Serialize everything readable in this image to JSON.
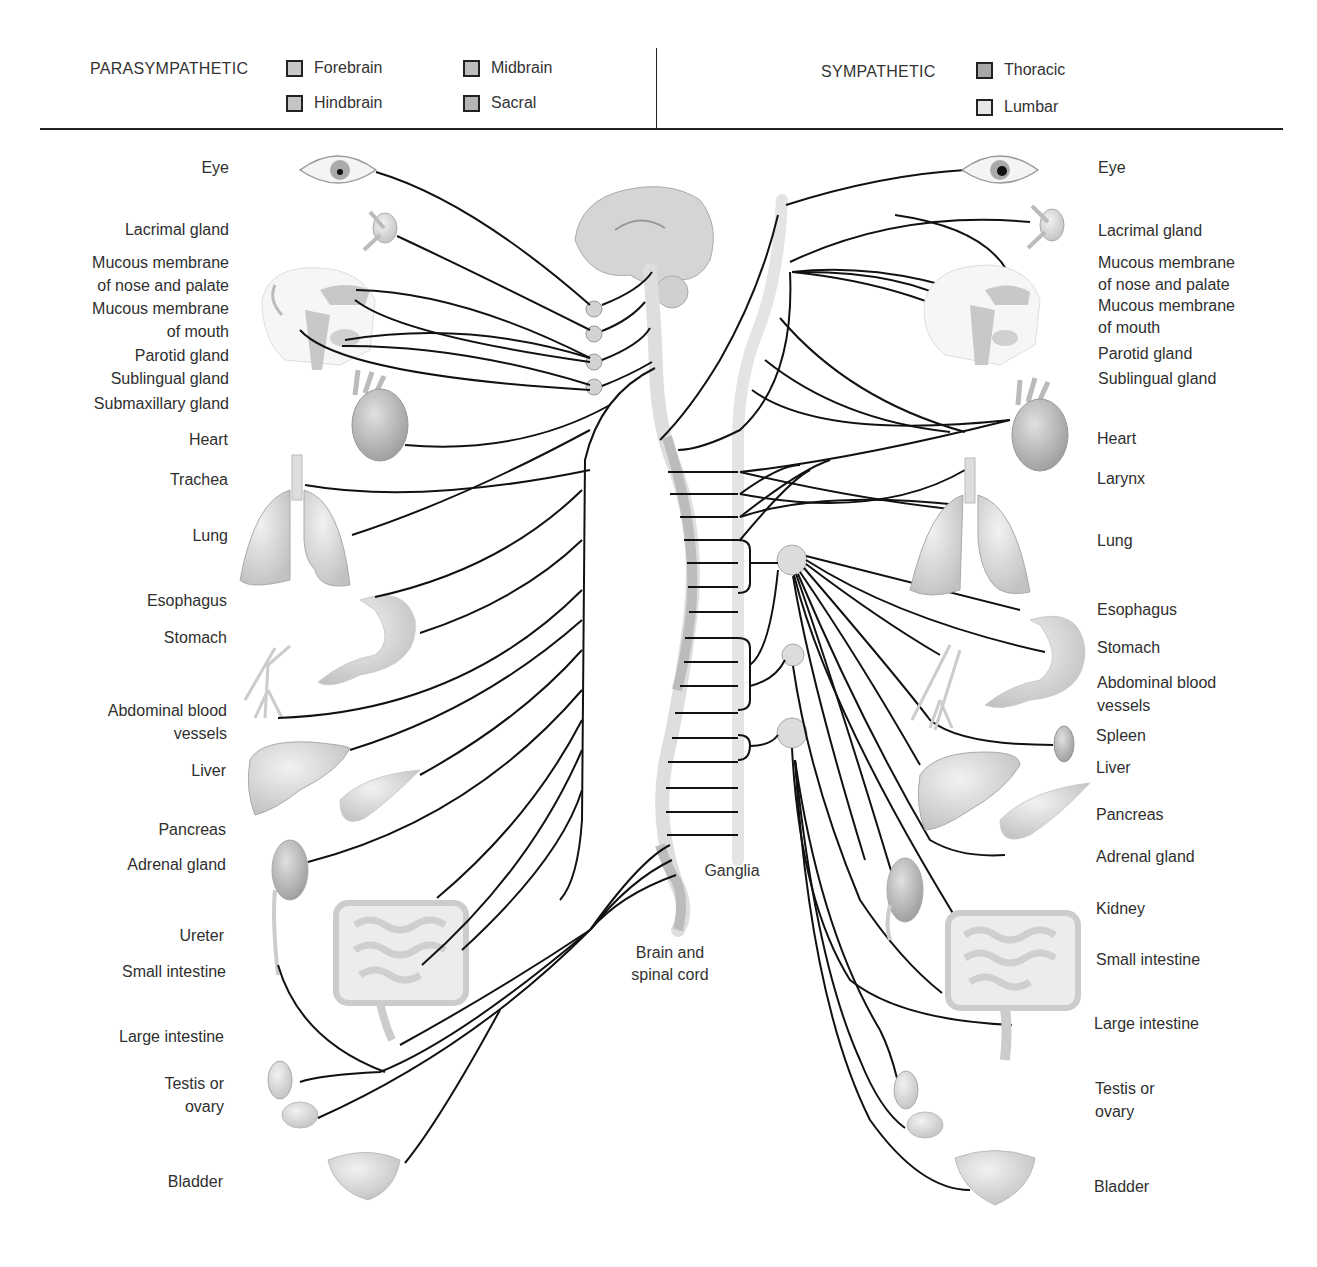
{
  "legend": {
    "parasympathetic": {
      "title": "PARASYMPATHETIC",
      "items": [
        {
          "label": "Forebrain",
          "color": "#c8c8c8"
        },
        {
          "label": "Midbrain",
          "color": "#bdbdbd"
        },
        {
          "label": "Hindbrain",
          "color": "#c4c4c4"
        },
        {
          "label": "Sacral",
          "color": "#b5b5b5"
        }
      ]
    },
    "sympathetic": {
      "title": "SYMPATHETIC",
      "items": [
        {
          "label": "Thoracic",
          "color": "#a8a8a8"
        },
        {
          "label": "Lumbar",
          "color": "#e6e6e6"
        }
      ]
    }
  },
  "parasympathetic_organs": [
    {
      "label": "Eye"
    },
    {
      "label": "Lacrimal gland"
    },
    {
      "label": "Mucous membrane\nof nose and palate"
    },
    {
      "label": "Mucous membrane\nof mouth"
    },
    {
      "label": "Parotid gland"
    },
    {
      "label": "Sublingual gland"
    },
    {
      "label": "Submaxillary gland"
    },
    {
      "label": "Heart"
    },
    {
      "label": "Trachea"
    },
    {
      "label": "Lung"
    },
    {
      "label": "Esophagus"
    },
    {
      "label": "Stomach"
    },
    {
      "label": "Abdominal blood\nvessels"
    },
    {
      "label": "Liver"
    },
    {
      "label": "Pancreas"
    },
    {
      "label": "Adrenal gland"
    },
    {
      "label": "Ureter"
    },
    {
      "label": "Small intestine"
    },
    {
      "label": "Large intestine"
    },
    {
      "label": "Testis or\novary"
    },
    {
      "label": "Bladder"
    }
  ],
  "sympathetic_organs": [
    {
      "label": "Eye"
    },
    {
      "label": "Lacrimal gland"
    },
    {
      "label": "Mucous membrane\nof nose and palate\nMucous membrane\nof mouth"
    },
    {
      "label": "Parotid gland"
    },
    {
      "label": "Sublingual gland"
    },
    {
      "label": "Heart"
    },
    {
      "label": "Larynx"
    },
    {
      "label": "Lung"
    },
    {
      "label": "Esophagus"
    },
    {
      "label": "Stomach"
    },
    {
      "label": "Abdominal blood\nvessels"
    },
    {
      "label": "Spleen"
    },
    {
      "label": "Liver"
    },
    {
      "label": "Pancreas"
    },
    {
      "label": "Adrenal gland"
    },
    {
      "label": "Kidney"
    },
    {
      "label": "Small intestine"
    },
    {
      "label": "Large intestine"
    },
    {
      "label": "Testis or\novary"
    },
    {
      "label": "Bladder"
    }
  ],
  "captions": {
    "ganglia": "Ganglia",
    "brain_spinal_cord": "Brain and\nspinal cord"
  },
  "colors": {
    "nerve": "#111111",
    "organ_fill": "#d9d9d9",
    "organ_stroke": "#b0b0b0",
    "cord_light": "#e4e4e4",
    "cord_dark": "#b8b8b8",
    "ganglion": "#d6d6d6"
  }
}
